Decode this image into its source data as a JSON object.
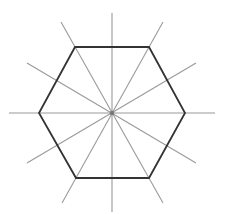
{
  "diagram": {
    "title": "",
    "type": "regular-hexagon-with-symmetry-axes",
    "canvas": {
      "width": 228,
      "height": 214,
      "background": "#ffffff"
    },
    "center": {
      "x": 112,
      "y": 113
    },
    "hexagon": {
      "stroke": "#333333",
      "stroke_width": 1.8,
      "vertices": [
        {
          "x": 75,
          "y": 47
        },
        {
          "x": 149,
          "y": 47
        },
        {
          "x": 185,
          "y": 113
        },
        {
          "x": 149,
          "y": 178
        },
        {
          "x": 76,
          "y": 178
        },
        {
          "x": 39,
          "y": 113
        }
      ]
    },
    "spokes": {
      "stroke": "#9a9a9a",
      "count": 6,
      "lines": [
        {
          "name": "vertical-axis",
          "x1": 112,
          "y1": 13,
          "x2": 112,
          "y2": 212
        },
        {
          "name": "horizontal-axis",
          "x1": 9,
          "y1": 113,
          "x2": 215,
          "y2": 113
        },
        {
          "name": "axis-60-left",
          "x1": 61,
          "y1": 22,
          "x2": 163,
          "y2": 203
        },
        {
          "name": "axis-60-right",
          "x1": 163,
          "y1": 22,
          "x2": 62,
          "y2": 203
        },
        {
          "name": "axis-30-left",
          "x1": 27,
          "y1": 63,
          "x2": 196,
          "y2": 163
        },
        {
          "name": "axis-30-right",
          "x1": 196,
          "y1": 63,
          "x2": 27,
          "y2": 163
        }
      ]
    },
    "center_dot": {
      "r": 2.2,
      "color": "#777777"
    }
  }
}
